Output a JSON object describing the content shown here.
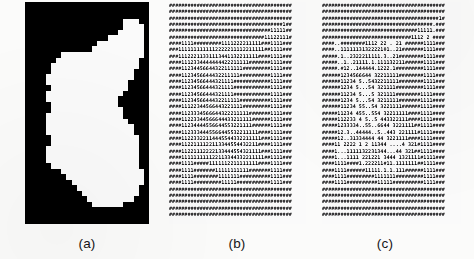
{
  "figure": {
    "panels": [
      {
        "id": "a",
        "caption": "(a)",
        "kind": "binary-raster-image",
        "description": "Binary segmented region: white object silhouette on black background",
        "foreground_color": "#ffffff",
        "background_color": "#08070a",
        "grid_cols": 24,
        "grid_rows": 40,
        "rows": [
          "000000000000000000000000",
          "000000000000000000000000",
          "000000000000000000000000",
          "000000000000000000011100",
          "000000000000000000011110",
          "000000000000000000111110",
          "000000000000000011111110",
          "000000000000001111111110",
          "000000000000011111111110",
          "000000011111111111111110",
          "000000111111111111111100",
          "000001111111111111111100",
          "000001111111111111111000",
          "000011111111111111111000",
          "000011111111111111110000",
          "000001111111111111110000",
          "000011111111111111100000",
          "000011111111111111000000",
          "000001111111111111000000",
          "000001111111111111100000",
          "000011111111111111100000",
          "000011111111111111110000",
          "000011111111111111111000",
          "000011111111111111111000",
          "000001111111111111111100",
          "000001111111111111111100",
          "000011111111111111111100",
          "000011111111111111111100",
          "000011111111111111111100",
          "000001111111111111111100",
          "000000011111111111111110",
          "000000001111111111111110",
          "000000000111111111111110",
          "000000000011111111111100",
          "000000000001111111111100",
          "000000000000111111111000",
          "000000000000011111100000",
          "000000000000000000000000",
          "000000000000000000000000",
          "000000000000000000000000"
        ]
      },
      {
        "id": "b",
        "caption": "(b)",
        "kind": "character-map",
        "description": "Dense ASCII character map of the region; '#' marks background, digits 1-6 encode interior values",
        "text_color": "#0b0a0c",
        "background_color": "#ffffff",
        "fill_char": "#",
        "value_chars": [
          "1",
          "2",
          "3",
          "4",
          "5",
          "6"
        ],
        "grid_cols": 40,
        "grid_rows": 34,
        "rows": [
          "########################################",
          "########################################",
          "########################################",
          "#####################################1##",
          "#################################11111##",
          "###############################11122111#",
          "####1111#########1111222211111###1111###",
          "###1111111111112222211112211111##1111###",
          "###11122211331113441132211111####1111###",
          "####1112334444444422211111#######1111###",
          "####11234456644322111111#########1111###",
          "####1123456644432211111##########1111###",
          "####11234566444321111############1111###",
          "####11234566444321111############1111###",
          "####11234566444321111############1111###",
          "####1123456644432211111##########1111###",
          "####11122344566443221111#########1111###",
          "####1123334566644322211111#######1111###",
          "####11223344566644433211111######1111###",
          "####11234444556644553221111######1111###",
          "####1123334445566445532211111####1111###",
          "####11223322114445544332211111###1111###",
          "####1122111122113344554432211####1111###",
          "####11221112222133444554321111###1111###",
          "####111111111122113344332211111##1111###",
          "####1111#####1111112211111111####1111###",
          "####1111#######11111111111#######1111###",
          "####1111########1111111##########1111###",
          "####1111#########11111###########1111###",
          "########################################",
          "########################################",
          "########################################",
          "########################################",
          "########################################"
        ]
      },
      {
        "id": "c",
        "caption": "(c)",
        "kind": "character-map",
        "description": "Filtered / thinned character map: background '#' retained, interior values sparser with blank gaps",
        "text_color": "#0b0a0c",
        "background_color": "#ffffff",
        "fill_char": "#",
        "blank_char": " ",
        "value_chars": [
          "1",
          "2",
          "3",
          "4",
          "5",
          "6"
        ],
        "grid_cols": 40,
        "grid_rows": 34,
        "rows": [
          "########################################",
          "########################################",
          "######################################1#",
          "####################################.###",
          "###############################11111.###",
          "#############################1112 2 ####",
          "####..########1112 22 . 21 ######1111###",
          "####..1111113132222101..21#######1111###",
          "#####.1..2322211111.3..21########1111###",
          "#####..1..21111.1.111132211######1111###",
          "#####.#12..144444.1222.1#########1111###",
          "######1234566644 32211111########1111###",
          "######11234 5..5432211111########1111###",
          "######1234 5...54 321111#########1111###",
          "######11234 5...5 321111########1111####",
          "######1234 5...54 3211111#######1111####",
          "######11234 55..54 3221111######1111####",
          "#####11234 455..554 32211111####1111####",
          "#####112233 4 5..5 443322111####1111####",
          "#####1233334..55..6644 3221111##1111####",
          "#####12.3..44444..5..443 221111#1111####",
          "#####12..31334444 44 3221111####1111####",
          "####11 2222 1 2 11344 ....4 321#1111####",
          "####1...1111132231344...44 321##1111####",
          "####1...1111 221221 3444 1321111#1111###",
          "####1111####1.222211#11.1111111##1111###",
          "####1111######11111.1.1.111######1111###",
          "####1111#########1111111#########1111###",
          "####1111##########11111##########1111###",
          "########################################",
          "########################################",
          "########################################",
          "########################################",
          "########################################"
        ]
      }
    ]
  }
}
